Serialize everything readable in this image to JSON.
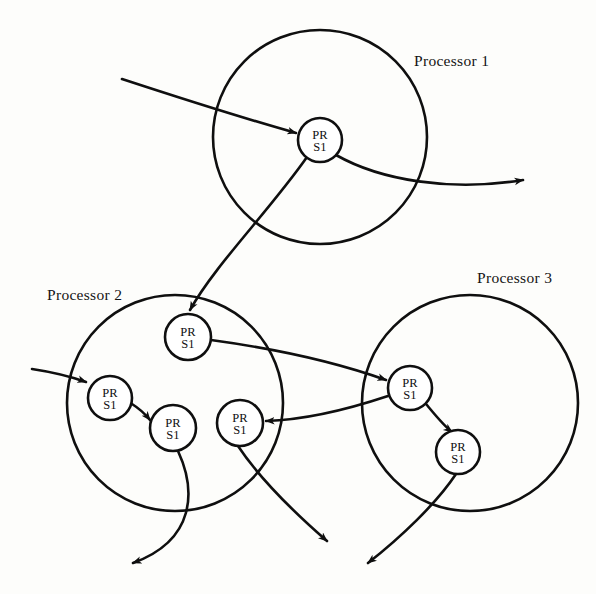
{
  "diagram": {
    "background_color": "#fdfdfb",
    "stroke_color": "#0f0f0f",
    "node_fill_color": "#ffffff",
    "node_label_line1": "PR",
    "node_label_line2": "S1",
    "processors": [
      {
        "id": "processor-1",
        "label": "Processor 1",
        "label_x": 414,
        "label_y": 66,
        "cx": 320,
        "cy": 137,
        "r": 107,
        "nodes": [
          {
            "id": "p1-n1",
            "cx": 320,
            "cy": 140,
            "r": 22,
            "line1": "PR",
            "line2": "S1"
          }
        ]
      },
      {
        "id": "processor-2",
        "label": "Processor 2",
        "label_x": 47,
        "label_y": 300,
        "cx": 175,
        "cy": 403,
        "r": 108,
        "nodes": [
          {
            "id": "p2-n1",
            "cx": 188,
            "cy": 337,
            "r": 23,
            "line1": "PR",
            "line2": "S1"
          },
          {
            "id": "p2-n2",
            "cx": 110,
            "cy": 398,
            "r": 22,
            "line1": "PR",
            "line2": "S1"
          },
          {
            "id": "p2-n3",
            "cx": 173,
            "cy": 428,
            "r": 23,
            "line1": "PR",
            "line2": "S1"
          },
          {
            "id": "p2-n4",
            "cx": 240,
            "cy": 423,
            "r": 23,
            "line1": "PR",
            "line2": "S1"
          }
        ]
      },
      {
        "id": "processor-3",
        "label": "Processor 3",
        "label_x": 477,
        "label_y": 283,
        "cx": 470,
        "cy": 403,
        "r": 108,
        "nodes": [
          {
            "id": "p3-n1",
            "cx": 410,
            "cy": 388,
            "r": 22,
            "line1": "PR",
            "line2": "S1"
          },
          {
            "id": "p3-n2",
            "cx": 458,
            "cy": 452,
            "r": 22,
            "line1": "PR",
            "line2": "S1"
          }
        ]
      }
    ],
    "edges": [
      {
        "id": "edge-in-p1",
        "name": "incoming-message-to-processor-1",
        "d": "M 122 79 C 180 98, 250 120, 296 133",
        "arrow": true
      },
      {
        "id": "edge-out-p1",
        "name": "outgoing-message-from-processor-1",
        "d": "M 336 155 C 380 180, 450 192, 523 180",
        "arrow": true
      },
      {
        "id": "edge-p1-p2",
        "name": "message-processor-1-to-processor-2",
        "d": "M 307 157 C 270 210, 215 265, 190 310",
        "arrow": true
      },
      {
        "id": "edge-in-p2",
        "name": "incoming-message-to-processor-2",
        "d": "M 32 369 C 52 372, 72 377, 86 382",
        "arrow": true
      },
      {
        "id": "edge-p2-n2-n3",
        "name": "message-p2-node2-to-node3",
        "d": "M 132 404 C 140 409, 146 415, 150 420",
        "arrow": true
      },
      {
        "id": "edge-p2-p3",
        "name": "message-processor-2-to-processor-3",
        "d": "M 211 340 C 270 348, 330 360, 386 380",
        "arrow": true
      },
      {
        "id": "edge-p3-p2",
        "name": "message-processor-3-to-processor-2",
        "d": "M 388 396 C 340 412, 300 420, 266 421",
        "arrow": true
      },
      {
        "id": "edge-p3-n1-n2",
        "name": "message-p3-node1-to-node2",
        "d": "M 426 404 C 436 416, 444 426, 452 432",
        "arrow": true
      },
      {
        "id": "edge-out-p2-left",
        "name": "outgoing-message-bottom-left",
        "d": "M 178 451 C 196 490, 196 540, 133 563",
        "arrow": true
      },
      {
        "id": "edge-out-p2-right",
        "name": "outgoing-message-bottom-center",
        "d": "M 238 446 C 262 482, 296 514, 327 541",
        "arrow": true
      },
      {
        "id": "edge-out-p3",
        "name": "outgoing-message-bottom-right",
        "d": "M 456 474 C 436 504, 400 538, 368 563",
        "arrow": true
      }
    ]
  }
}
